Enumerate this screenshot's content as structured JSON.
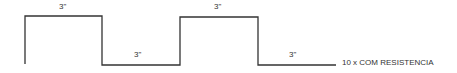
{
  "diagram": {
    "type": "square-wave timing diagram",
    "segments": [
      {
        "state": "high",
        "duration_label": "3\""
      },
      {
        "state": "low",
        "duration_label": "3\""
      },
      {
        "state": "high",
        "duration_label": "3\""
      },
      {
        "state": "low",
        "duration_label": "3\""
      }
    ],
    "caption": "10 x COM RESISTENCIA",
    "line_color": "#333333"
  }
}
